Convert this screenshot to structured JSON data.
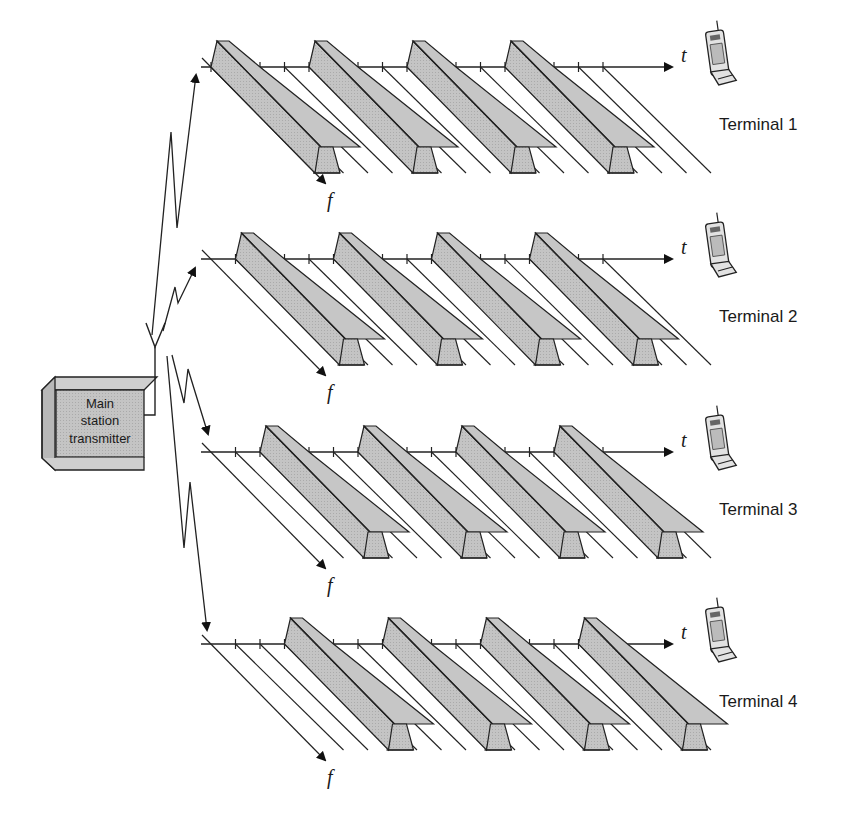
{
  "diagram": {
    "transmitter": {
      "label_lines": [
        "Main",
        "station",
        "transmitter"
      ]
    },
    "axis_labels": {
      "time": "t",
      "frequency": "f"
    },
    "colors": {
      "slot_fill": "#bdbdbd",
      "slot_top": "#c8c8c8",
      "slot_front": "#b2b2b2",
      "stroke": "#222222"
    },
    "slots_per_frame": 4,
    "frames_shown": 4,
    "terminals": [
      {
        "label": "Terminal 1",
        "active_slot": 0
      },
      {
        "label": "Terminal 2",
        "active_slot": 1
      },
      {
        "label": "Terminal 3",
        "active_slot": 2
      },
      {
        "label": "Terminal 4",
        "active_slot": 3
      }
    ]
  }
}
